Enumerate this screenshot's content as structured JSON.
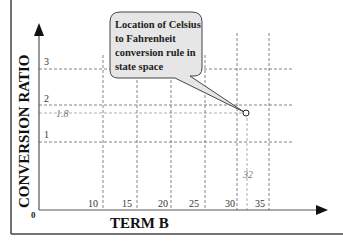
{
  "diagram": {
    "y_axis_label": "CONVERSION RATIO",
    "x_axis_label": "TERM B",
    "origin_label": "0",
    "y_ticks": [
      {
        "label": "3",
        "value": 3
      },
      {
        "label": "2",
        "value": 2
      },
      {
        "label": "1.8",
        "value": 1.8,
        "highlight": true
      },
      {
        "label": "1",
        "value": 1
      }
    ],
    "x_ticks": [
      {
        "label": "10",
        "value": 10
      },
      {
        "label": "15",
        "value": 15
      },
      {
        "label": "20",
        "value": 20
      },
      {
        "label": "25",
        "value": 25
      },
      {
        "label": "30",
        "value": 30
      },
      {
        "label": "32",
        "value": 32,
        "highlight": true
      },
      {
        "label": "35",
        "value": 35
      }
    ],
    "point": {
      "x": 32,
      "y": 1.8
    },
    "callout": {
      "lines": [
        "Location of Celsius",
        "to Fahrenheit",
        "conversion rule in",
        "state space"
      ]
    }
  }
}
